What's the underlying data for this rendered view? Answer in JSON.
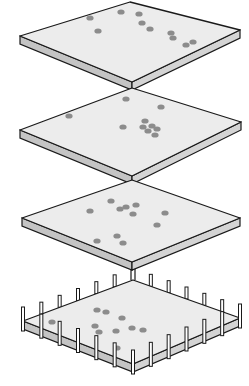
{
  "diagram": {
    "colors": {
      "top_face": "#ececec",
      "side_face": "#c4c4c4",
      "outline": "#1a1a1a",
      "dot": "#8c8c8c",
      "background": "#ffffff"
    },
    "layers": [
      {
        "name": "layer-1",
        "top": [
          [
            130,
            2
          ],
          [
            240,
            30
          ],
          [
            132,
            82
          ],
          [
            20,
            36
          ]
        ],
        "thick": 8,
        "dots": [
          [
            90,
            18
          ],
          [
            121,
            12
          ],
          [
            139,
            14
          ],
          [
            142,
            23
          ],
          [
            150,
            29
          ],
          [
            98,
            31
          ],
          [
            171,
            33
          ],
          [
            173,
            38
          ],
          [
            186,
            45
          ],
          [
            193,
            42
          ]
        ]
      },
      {
        "name": "layer-2",
        "top": [
          [
            132,
            88
          ],
          [
            241,
            122
          ],
          [
            132,
            176
          ],
          [
            20,
            130
          ]
        ],
        "thick": 8,
        "dots": [
          [
            126,
            99
          ],
          [
            161,
            107
          ],
          [
            69,
            116
          ],
          [
            145,
            121
          ],
          [
            152,
            126
          ],
          [
            157,
            129
          ],
          [
            123,
            127
          ],
          [
            155,
            135
          ],
          [
            148,
            131
          ],
          [
            143,
            127
          ]
        ]
      },
      {
        "name": "layer-3",
        "top": [
          [
            132,
            180
          ],
          [
            240,
            218
          ],
          [
            132,
            262
          ],
          [
            22,
            218
          ]
        ],
        "thick": 8,
        "dots": [
          [
            111,
            201
          ],
          [
            90,
            211
          ],
          [
            120,
            209
          ],
          [
            126,
            207
          ],
          [
            136,
            205
          ],
          [
            133,
            214
          ],
          [
            165,
            213
          ],
          [
            157,
            225
          ],
          [
            117,
            236
          ],
          [
            123,
            243
          ],
          [
            97,
            241
          ]
        ]
      },
      {
        "name": "layer-4-fenced",
        "top": [
          [
            133,
            280
          ],
          [
            240,
            318
          ],
          [
            133,
            364
          ],
          [
            23,
            321
          ]
        ],
        "thick": 8,
        "dots": [
          [
            97,
            310
          ],
          [
            106,
            312
          ],
          [
            122,
            318
          ],
          [
            52,
            322
          ],
          [
            95,
            326
          ],
          [
            99,
            332
          ],
          [
            116,
            331
          ],
          [
            132,
            328
          ],
          [
            143,
            330
          ],
          [
            117,
            348
          ]
        ]
      }
    ],
    "connector": {
      "x": 133,
      "y1": 262,
      "y2": 280
    }
  }
}
